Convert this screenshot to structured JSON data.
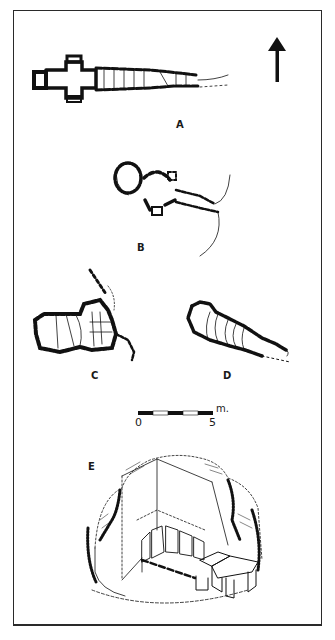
{
  "figure": {
    "panels": [
      {
        "id": "A",
        "label": "A",
        "description": "plan of elongated passage tomb with cruciform chamber"
      },
      {
        "id": "B",
        "label": "B",
        "description": "plan of tomb with round chamber and side cells"
      },
      {
        "id": "C",
        "label": "C",
        "description": "plan of tomb with segmented chamber and passage"
      },
      {
        "id": "D",
        "label": "D",
        "description": "plan of tapering gallery tomb"
      },
      {
        "id": "E",
        "label": "E",
        "description": "isometric cut-away reconstruction of cairn with chamber"
      }
    ],
    "north_arrow": {
      "direction": "north"
    },
    "scale_bar": {
      "start_label": "0",
      "end_label": "5",
      "unit": "m.",
      "segments": 5
    }
  },
  "colors": {
    "ink": "#1a1a1a",
    "paper": "#ffffff",
    "frame": "#2a2a2a"
  }
}
